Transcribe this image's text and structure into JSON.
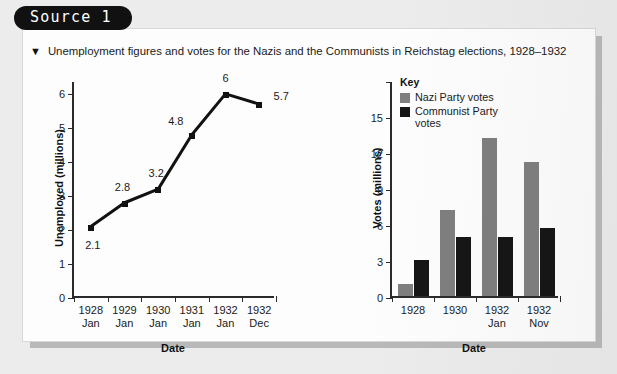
{
  "source_badge": "Source 1",
  "caption": {
    "bullet": "▼",
    "text": "Unemployment figures and votes for the Nazis and the Communists in Reichstag elections, 1928–1932"
  },
  "colors": {
    "nazi": "#7f7f7f",
    "communist": "#161616",
    "axis": "#2b2b2b",
    "card": "#fdfdfd",
    "page": "#ececed"
  },
  "chart_data": [
    {
      "type": "line",
      "title": "",
      "xlabel": "Date",
      "ylabel": "Unemployed (millions)",
      "categories": [
        "1928 Jan",
        "1929 Jan",
        "1930 Jan",
        "1931 Jan",
        "1932 Jan",
        "1932 Dec"
      ],
      "category_lines": [
        [
          "1928",
          "Jan"
        ],
        [
          "1929",
          "Jan"
        ],
        [
          "1930",
          "Jan"
        ],
        [
          "1931",
          "Jan"
        ],
        [
          "1932",
          "Jan"
        ],
        [
          "1932",
          "Dec"
        ]
      ],
      "values": [
        2.1,
        2.8,
        3.2,
        4.8,
        6,
        5.7
      ],
      "point_labels": [
        "2.1",
        "2.8",
        "3.2",
        "4.8",
        "6",
        "5.7"
      ],
      "yticks": [
        0,
        1,
        2,
        3,
        4,
        5,
        6
      ],
      "ytick_labels": [
        "0",
        "1",
        "2",
        "3",
        "4",
        "5",
        "6"
      ],
      "ylim": [
        0,
        6.35
      ],
      "grid": false,
      "legend": "none",
      "marker": "square"
    },
    {
      "type": "bar",
      "title": "",
      "xlabel": "Date",
      "ylabel": "Votes (millions)",
      "categories": [
        "1928",
        "1930",
        "1932 Jan",
        "1932 Nov"
      ],
      "category_lines": [
        [
          "1928",
          ""
        ],
        [
          "1930",
          ""
        ],
        [
          "1932",
          "Jan"
        ],
        [
          "1932",
          "Nov"
        ]
      ],
      "series": [
        {
          "name": "Nazi Party votes",
          "values": [
            1.0,
            7.2,
            13.2,
            11.2
          ],
          "color": "#7f7f7f"
        },
        {
          "name": "Communist Party votes",
          "values": [
            3.0,
            4.9,
            4.9,
            5.7
          ],
          "color": "#161616"
        }
      ],
      "yticks": [
        0,
        3,
        6,
        9,
        12,
        15,
        18
      ],
      "ytick_labels": [
        "0",
        "3",
        "6",
        "9",
        "12",
        "15",
        ""
      ],
      "ylim": [
        0,
        18
      ],
      "grid": false,
      "legend": "inside-top-left",
      "legend_title": "Key"
    }
  ]
}
